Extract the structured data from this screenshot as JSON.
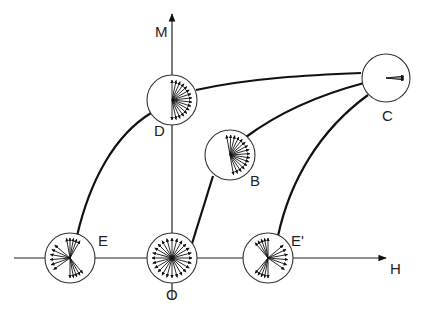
{
  "axes": {
    "x_label": "H",
    "y_label": "M"
  },
  "states": [
    {
      "id": "O",
      "label": "O",
      "description": "demagnetized, domains uniformly distributed"
    },
    {
      "id": "D",
      "label": "D",
      "description": "domains oriented in upper half (toward +H right half)"
    },
    {
      "id": "B",
      "label": "B",
      "description": "domains partially aligned"
    },
    {
      "id": "C",
      "label": "C",
      "description": "saturation, domains aligned with H"
    },
    {
      "id": "E",
      "label": "E",
      "description": "domains oriented mostly to left"
    },
    {
      "id": "E_prime",
      "label": "E'",
      "description": "domains oriented mostly to right"
    }
  ],
  "paths": [
    {
      "from": "O",
      "to": "B"
    },
    {
      "from": "B",
      "to": "C"
    },
    {
      "from": "D",
      "to": "C"
    },
    {
      "from": "E",
      "to": "D"
    },
    {
      "from": "E_prime",
      "to": "C"
    }
  ],
  "colors": {
    "line": "#111111",
    "circle": "#333333",
    "background": "#ffffff"
  }
}
